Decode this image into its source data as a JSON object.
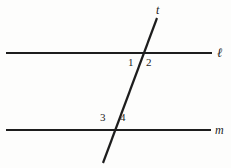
{
  "figure": {
    "background_color": "#fdfdfc",
    "stroke_color": "#1d1d1d",
    "width": 231,
    "height": 168,
    "lines": [
      {
        "id": "line-l",
        "name": "line-l",
        "label": "ℓ",
        "label_style": "script",
        "x1": 6,
        "y1": 53,
        "x2": 212,
        "y2": 53,
        "stroke_width": 2.2,
        "label_x": 217,
        "label_y": 46
      },
      {
        "id": "line-m",
        "name": "line-m",
        "label": "m",
        "label_style": "italic",
        "x1": 6,
        "y1": 130,
        "x2": 211,
        "y2": 130,
        "stroke_width": 2.2,
        "label_x": 215,
        "label_y": 124
      },
      {
        "id": "line-t",
        "name": "transversal-t",
        "label": "t",
        "label_style": "italic",
        "x1": 157,
        "y1": 18,
        "x2": 103,
        "y2": 163,
        "stroke_width": 2.2,
        "label_x": 156,
        "label_y": 4
      }
    ],
    "angle_labels": [
      {
        "id": "angle-1",
        "text": "1",
        "x": 128,
        "y": 57
      },
      {
        "id": "angle-2",
        "text": "2",
        "x": 146,
        "y": 57
      },
      {
        "id": "angle-3",
        "text": "3",
        "x": 100,
        "y": 112
      },
      {
        "id": "angle-4",
        "text": "4",
        "x": 120,
        "y": 112
      }
    ],
    "intersections": [
      {
        "id": "intersection-l-t",
        "x": 143,
        "y": 53
      },
      {
        "id": "intersection-m-t",
        "x": 115,
        "y": 130
      }
    ]
  }
}
